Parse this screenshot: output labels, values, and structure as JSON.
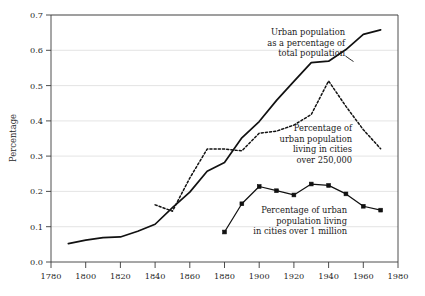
{
  "chart_data": {
    "type": "line",
    "title": "",
    "xlabel": "",
    "ylabel": "Percentage",
    "xlim": [
      1780,
      1980
    ],
    "ylim": [
      0.0,
      0.7
    ],
    "grid": true,
    "legend_position": "inline-annotations",
    "x_ticks": [
      1780,
      1800,
      1820,
      1840,
      1860,
      1880,
      1900,
      1920,
      1940,
      1960,
      1980
    ],
    "x_tick_labels": [
      "1780",
      "1800",
      "1820",
      "1840",
      "1860",
      "1880",
      "1900",
      "1920",
      "1940",
      "1960",
      "1980"
    ],
    "y_ticks": [
      0.0,
      0.1,
      0.2,
      0.3,
      0.4,
      0.5,
      0.6,
      0.7
    ],
    "y_tick_labels": [
      "0.0",
      "0.1",
      "0.2",
      "0.3",
      "0.4",
      "0.5",
      "0.6",
      "0.7"
    ],
    "series": [
      {
        "name": "Urban population as a percentage of total population",
        "style": "solid",
        "markers": false,
        "x": [
          1790,
          1800,
          1810,
          1820,
          1830,
          1840,
          1850,
          1860,
          1870,
          1880,
          1890,
          1900,
          1910,
          1920,
          1930,
          1940,
          1950,
          1960,
          1970
        ],
        "values": [
          0.052,
          0.062,
          0.069,
          0.071,
          0.087,
          0.107,
          0.154,
          0.198,
          0.257,
          0.282,
          0.352,
          0.398,
          0.458,
          0.512,
          0.565,
          0.569,
          0.602,
          0.645,
          0.658
        ]
      },
      {
        "name": "Percentage of urban population living in cities over 250,000",
        "style": "dotted",
        "markers": false,
        "x": [
          1840,
          1850,
          1860,
          1870,
          1880,
          1890,
          1900,
          1910,
          1920,
          1930,
          1940,
          1950,
          1960,
          1970
        ],
        "values": [
          0.162,
          0.144,
          0.238,
          0.32,
          0.32,
          0.315,
          0.365,
          0.371,
          0.388,
          0.418,
          0.513,
          0.441,
          0.375,
          0.321
        ]
      },
      {
        "name": "Percentage of urban population living in cities over 1 million",
        "style": "solid-markers",
        "markers": true,
        "x": [
          1880,
          1890,
          1900,
          1910,
          1920,
          1930,
          1940,
          1950,
          1960,
          1970
        ],
        "values": [
          0.085,
          0.165,
          0.214,
          0.202,
          0.19,
          0.221,
          0.217,
          0.193,
          0.158,
          0.147
        ]
      }
    ],
    "annotations": [
      {
        "id": "annot-total-population",
        "lines": [
          "Urban population",
          "as a percentage of",
          "total population"
        ]
      },
      {
        "id": "annot-cities-250k",
        "lines": [
          "Percentage of",
          "urban population",
          "living in cities",
          "over 250,000"
        ]
      },
      {
        "id": "annot-cities-1m",
        "lines": [
          "Percentage of urban",
          "population living",
          "in cities over 1 million"
        ]
      }
    ]
  },
  "axes": {
    "y_axis_title": "Percentage"
  }
}
